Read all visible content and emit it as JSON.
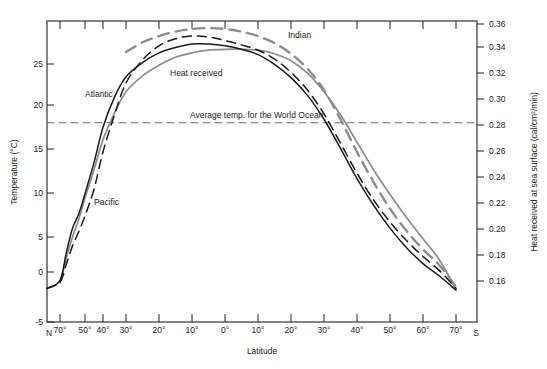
{
  "chart_data": {
    "type": "line",
    "title": "",
    "xlabel": "Latitude",
    "ylabel_left": "Temperature  (°C)",
    "ylabel_right": "Heat received at sea surface  (cal/cm²/min)",
    "ylim_left": [
      -5,
      29
    ],
    "ylim_right": [
      0.1448,
      0.3768
    ],
    "grid": false,
    "legend_position": "inline-annotations",
    "x_axis": {
      "hemisphere_left": "N",
      "hemisphere_right": "S",
      "tick_labels": [
        "70°",
        "50°",
        "40°",
        "30°",
        "20°",
        "10°",
        "0°",
        "10°",
        "20°",
        "30°",
        "40°",
        "50°",
        "60°",
        "70°"
      ],
      "tick_values": [
        -70,
        -50,
        -40,
        -30,
        -20,
        -10,
        0,
        10,
        20,
        30,
        40,
        50,
        60,
        70
      ]
    },
    "y_axis_left": {
      "tick_labels": [
        "-5",
        "0",
        "5",
        "10",
        "15",
        "20",
        "25"
      ],
      "tick_values": [
        -5,
        0,
        5,
        10,
        15,
        20,
        25
      ]
    },
    "y_axis_right": {
      "tick_labels": [
        "0.16",
        "0.18",
        "0.20",
        "0.22",
        "0.24",
        "0.26",
        "0.28",
        "0.30",
        "0.32",
        "0.34",
        "0.36"
      ],
      "tick_values": [
        0.16,
        0.18,
        0.2,
        0.22,
        0.24,
        0.26,
        0.28,
        0.3,
        0.32,
        0.34,
        0.36
      ]
    },
    "annotations": [
      {
        "name": "indian-label",
        "text": "Indian",
        "x": 288,
        "y": 38
      },
      {
        "name": "atlantic-label",
        "text": "Atlantic",
        "x": 85,
        "y": 97
      },
      {
        "name": "heat-label",
        "text": "Heat received",
        "x": 170,
        "y": 76
      },
      {
        "name": "pacific-label",
        "text": "Pacific",
        "x": 94,
        "y": 205
      },
      {
        "name": "average-label",
        "text": "Average temp. for the World Ocean",
        "x": 190,
        "y": 118
      }
    ],
    "series": [
      {
        "name": "Atlantic",
        "style": "solid",
        "color": "#1a1a1a",
        "x": [
          -72,
          -70,
          -65,
          -60,
          -55,
          -50,
          -45,
          -40,
          -35,
          -30,
          -25,
          -20,
          -15,
          -10,
          -5,
          0,
          5,
          10,
          15,
          20,
          25,
          30,
          35,
          40,
          45,
          50,
          55,
          60,
          65,
          70
        ],
        "values": [
          -1.2,
          -0.3,
          2.8,
          5.6,
          7.2,
          9.5,
          13.0,
          17.0,
          20.4,
          22.7,
          24.3,
          25.4,
          26.0,
          26.4,
          26.4,
          26.2,
          25.8,
          25.2,
          24.1,
          22.6,
          20.6,
          17.9,
          14.6,
          11.2,
          8.2,
          5.6,
          3.4,
          1.6,
          0.2,
          -1.4
        ]
      },
      {
        "name": "Pacific",
        "style": "dashed",
        "color": "#1a1a1a",
        "x": [
          -72,
          -70,
          -65,
          -60,
          -55,
          -50,
          -45,
          -40,
          -35,
          -30,
          -25,
          -20,
          -15,
          -10,
          -5,
          0,
          5,
          10,
          15,
          20,
          25,
          30,
          35,
          40,
          45,
          50,
          55,
          60,
          65,
          70
        ],
        "values": [
          -1.2,
          -0.5,
          1.5,
          3.6,
          5.2,
          7.0,
          10.0,
          14.2,
          18.4,
          22.0,
          24.6,
          26.2,
          27.0,
          27.3,
          27.2,
          26.8,
          26.3,
          25.7,
          24.7,
          23.2,
          21.2,
          18.5,
          15.2,
          11.8,
          8.8,
          6.3,
          4.2,
          2.4,
          0.8,
          -1.2
        ]
      },
      {
        "name": "Indian",
        "style": "long-dashed",
        "color": "#8c8c8c",
        "x": [
          -30,
          -25,
          -20,
          -15,
          -10,
          -5,
          0,
          5,
          10,
          15,
          20,
          25,
          30,
          35,
          40,
          45,
          50,
          55,
          60,
          65,
          70
        ],
        "values": [
          25.5,
          26.6,
          27.3,
          27.8,
          28.1,
          28.2,
          28.1,
          27.8,
          27.3,
          26.5,
          25.3,
          23.6,
          21.2,
          17.9,
          14.2,
          10.8,
          7.8,
          5.3,
          3.2,
          1.4,
          -1.0
        ]
      },
      {
        "name": "Heat received",
        "style": "solid",
        "color": "#8c8c8c",
        "x": [
          -70,
          -65,
          -60,
          -55,
          -50,
          -45,
          -40,
          -35,
          -30,
          -25,
          -20,
          -15,
          -10,
          -5,
          0,
          5,
          10,
          15,
          20,
          25,
          30,
          35,
          40,
          45,
          50,
          55,
          60,
          65,
          70
        ],
        "values": [
          -0.6,
          2.2,
          4.6,
          6.6,
          9.0,
          12.2,
          15.6,
          18.6,
          21.0,
          22.8,
          24.0,
          24.9,
          25.4,
          25.7,
          25.8,
          25.8,
          25.7,
          25.3,
          24.5,
          23.1,
          21.0,
          18.4,
          15.3,
          12.2,
          9.4,
          6.8,
          4.4,
          2.0,
          -1.3
        ]
      },
      {
        "name": "Average temp. for the World Ocean",
        "style": "dashed-horizontal",
        "color": "#6d6d6d",
        "constant_value": 17.5
      }
    ]
  }
}
